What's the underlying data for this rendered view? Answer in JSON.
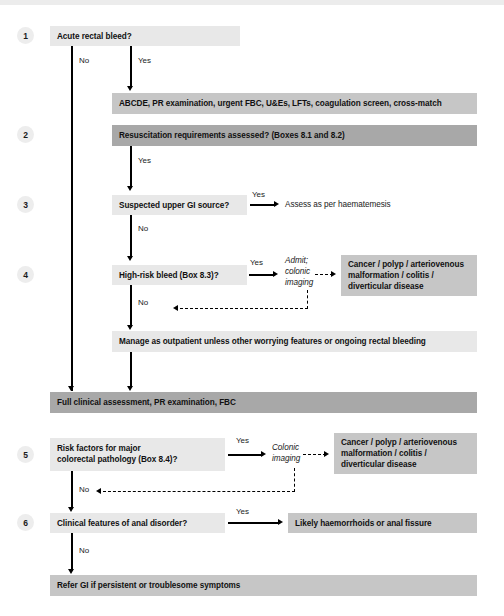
{
  "diagram": {
    "colors": {
      "light_box": "#e8e8e8",
      "mid_box": "#c6c6c6",
      "dark_box": "#a8a8a8",
      "connector": "#000000",
      "step_circle": "#ededed"
    }
  },
  "steps": {
    "s1": "1",
    "s2": "2",
    "s3": "3",
    "s4": "4",
    "s5": "5",
    "s6": "6"
  },
  "nodes": {
    "acute_rectal_bleed": "Acute rectal bleed?",
    "abcde": "ABCDE, PR examination, urgent FBC, U&Es, LFTs, coagulation screen, cross-match",
    "resuscitation": "Resuscitation requirements assessed? (Boxes 8.1 and 8.2)",
    "upper_gi": "Suspected upper GI source?",
    "haematemesis": "Assess as per haematemesis",
    "high_risk_bleed": "High-risk bleed (Box 8.3)?",
    "admit_colonic_imaging_l1": "Admit;",
    "admit_colonic_imaging_l2": "colonic",
    "admit_colonic_imaging_l3": "imaging",
    "cancer_outcome_4": "Cancer / polyp / arteriovenous malformation / colitis / diverticular disease",
    "manage_outpatient": "Manage as outpatient unless other worrying features or ongoing rectal bleeding",
    "full_clinical": "Full clinical assessment, PR examination, FBC",
    "risk_factors_l1": "Risk factors for major",
    "risk_factors_l2": "colorectal pathology (Box 8.4)?",
    "colonic_imaging_l1": "Colonic",
    "colonic_imaging_l2": "imaging",
    "cancer_outcome_5": "Cancer / polyp / arteriovenous malformation / colitis / diverticular disease",
    "anal_disorder": "Clinical features of anal disorder?",
    "haemorrhoids": "Likely haemorrhoids or anal fissure",
    "refer_gi": "Refer GI if persistent or troublesome symptoms"
  },
  "edges": {
    "no1": "No",
    "yes1": "Yes",
    "yes2": "Yes",
    "yes3": "Yes",
    "no3": "No",
    "yes4": "Yes",
    "no4": "No",
    "yes5": "Yes",
    "no5": "No",
    "yes6": "Yes",
    "no6": "No"
  }
}
